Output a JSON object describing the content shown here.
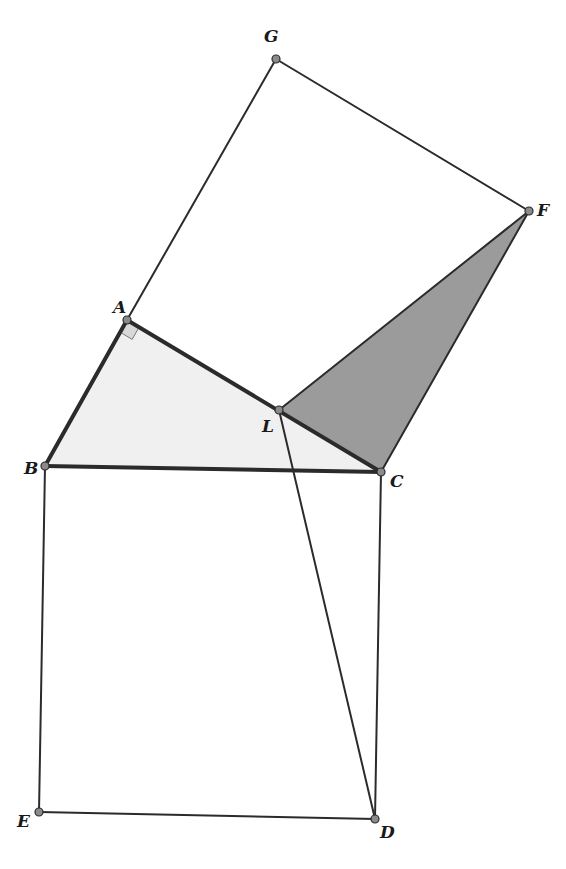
{
  "diagram": {
    "type": "geometric-construction",
    "colors": {
      "background": "#ffffff",
      "stroke": "#2b2b2b",
      "light_fill": "#f0f0f0",
      "dark_fill": "#9b9b9b",
      "right_angle_fill": "#d8d8d8",
      "point_fill": "#8a8a8a"
    },
    "points": {
      "G": {
        "label": "G",
        "x": 276,
        "y": 59
      },
      "F": {
        "label": "F",
        "x": 529,
        "y": 211
      },
      "A": {
        "label": "A",
        "x": 127,
        "y": 320
      },
      "L": {
        "label": "L",
        "x": 279,
        "y": 410
      },
      "B": {
        "label": "B",
        "x": 45,
        "y": 466
      },
      "C": {
        "label": "C",
        "x": 381,
        "y": 472
      },
      "E": {
        "label": "E",
        "x": 39,
        "y": 812
      },
      "D": {
        "label": "D",
        "x": 375,
        "y": 819
      }
    },
    "labels": [
      {
        "id": "G",
        "text": "G",
        "x": 264,
        "y": 42
      },
      {
        "id": "F",
        "text": "F",
        "x": 537,
        "y": 216
      },
      {
        "id": "A",
        "text": "A",
        "x": 113,
        "y": 313
      },
      {
        "id": "L",
        "text": "L",
        "x": 262,
        "y": 432
      },
      {
        "id": "B",
        "text": "B",
        "x": 24,
        "y": 474
      },
      {
        "id": "C",
        "text": "C",
        "x": 390,
        "y": 487
      },
      {
        "id": "E",
        "text": "E",
        "x": 17,
        "y": 827
      },
      {
        "id": "D",
        "text": "D",
        "x": 380,
        "y": 838
      }
    ],
    "regions": [
      {
        "name": "triangle-ABC",
        "vertices": [
          "A",
          "B",
          "C"
        ],
        "fill": "light"
      },
      {
        "name": "triangle-LFC",
        "vertices": [
          "L",
          "F",
          "C"
        ],
        "fill": "dark"
      }
    ],
    "segments": [
      {
        "from": "A",
        "to": "G",
        "weight": "thin"
      },
      {
        "from": "G",
        "to": "F",
        "weight": "thin"
      },
      {
        "from": "F",
        "to": "C",
        "weight": "thin"
      },
      {
        "from": "F",
        "to": "L",
        "weight": "thin"
      },
      {
        "from": "B",
        "to": "E",
        "weight": "thin"
      },
      {
        "from": "E",
        "to": "D",
        "weight": "thin"
      },
      {
        "from": "D",
        "to": "C",
        "weight": "thin"
      },
      {
        "from": "L",
        "to": "D",
        "weight": "thin"
      },
      {
        "from": "A",
        "to": "B",
        "weight": "thick"
      },
      {
        "from": "A",
        "to": "C",
        "weight": "thick"
      },
      {
        "from": "B",
        "to": "C",
        "weight": "thick"
      }
    ],
    "right_angle_marker": {
      "at": "A",
      "size": 14
    }
  }
}
